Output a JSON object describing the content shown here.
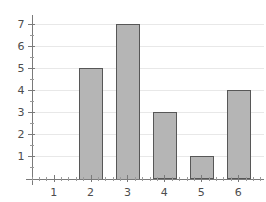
{
  "chart_data": {
    "type": "bar",
    "title": "",
    "subtitle": "",
    "xlabel": "",
    "ylabel": "",
    "categories": [
      "1",
      "2",
      "3",
      "4",
      "5",
      "6"
    ],
    "values": [
      0,
      5,
      7,
      3,
      1,
      4
    ],
    "series": [
      {
        "name": "frequency",
        "values": [
          0,
          5,
          7,
          3,
          1,
          4
        ]
      }
    ],
    "xlim": [
      0.4,
      6.7
    ],
    "ylim": [
      0,
      7.35
    ],
    "x_tick_labels": [
      "1",
      "2",
      "3",
      "4",
      "5",
      "6"
    ],
    "y_tick_labels": [
      "1",
      "2",
      "3",
      "4",
      "5",
      "6",
      "7"
    ],
    "y_tick_values": [
      1,
      2,
      3,
      4,
      5,
      6,
      7
    ],
    "x_minor_ticks_between": 4,
    "y_minor_ticks_between": 1,
    "grid": true,
    "grid_axis": "y",
    "legend": false,
    "legend_position": "none",
    "annotations": [],
    "colors": {
      "bar_fill": "#b5b5b5",
      "bar_stroke": "#575757",
      "gridline": "#e8e8e8",
      "axis": "#7a7a7a",
      "tick_text": "#4d4d4d",
      "background": "#ffffff"
    },
    "bar_width_units": 0.62
  }
}
